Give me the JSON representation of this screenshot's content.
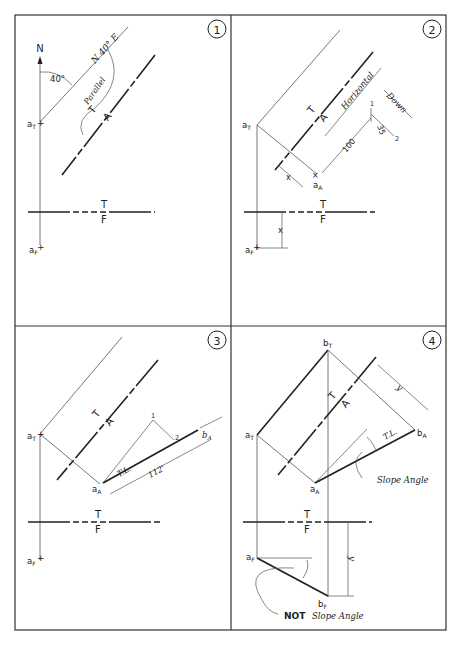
{
  "panels": [
    {
      "number": "1",
      "labels": {
        "north": "N",
        "bearing": "N 40° E",
        "angle": "40°",
        "parallel": "Parallel",
        "fold_top": "T",
        "fold_aux": "A",
        "tf_top": "T",
        "tf_front": "F",
        "a_top": "a",
        "a_top_sub": "T",
        "a_front": "a",
        "a_front_sub": "F"
      }
    },
    {
      "number": "2",
      "labels": {
        "horizontal": "Horizontal",
        "down": "Down",
        "slope_rise": "1",
        "slope_run": "2",
        "slope_val": "35",
        "hundred": "100",
        "x1": "x",
        "x2": "x",
        "fold_top": "T",
        "fold_aux": "A",
        "tf_top": "T",
        "tf_front": "F",
        "a_top": "a",
        "a_top_sub": "T",
        "a_aux": "a",
        "a_aux_sub": "A",
        "a_front": "a",
        "a_front_sub": "F"
      }
    },
    {
      "number": "3",
      "labels": {
        "p1": "1",
        "p2": "2",
        "tl": "T.L.",
        "len": "112'",
        "fold_top": "T",
        "fold_aux": "A",
        "tf_top": "T",
        "tf_front": "F",
        "a_top": "a",
        "a_top_sub": "T",
        "a_aux": "a",
        "a_aux_sub": "A",
        "b_aux": "b",
        "b_aux_sub": "A",
        "a_front": "a",
        "a_front_sub": "F"
      }
    },
    {
      "number": "4",
      "labels": {
        "y1": "y",
        "y2": "y",
        "tl": "T.L.",
        "slope_angle": "Slope Angle",
        "not_word": "NOT",
        "not_slope": "Slope Angle",
        "fold_top": "T",
        "fold_aux": "A",
        "tf_top": "T",
        "tf_front": "F",
        "a_top": "a",
        "a_top_sub": "T",
        "b_top": "b",
        "b_top_sub": "T",
        "a_aux": "a",
        "a_aux_sub": "A",
        "b_aux": "b",
        "b_aux_sub": "A",
        "a_front": "a",
        "a_front_sub": "F",
        "b_front": "b",
        "b_front_sub": "F"
      }
    }
  ],
  "colors": {
    "ink": "#222222",
    "border": "#333333",
    "thin": "#555555"
  }
}
